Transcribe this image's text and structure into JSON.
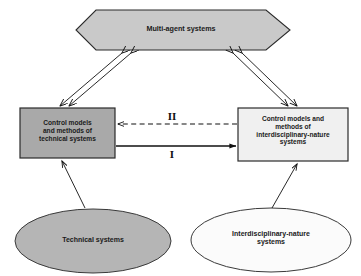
{
  "diagram": {
    "background_color": "#ffffff",
    "nodes": [
      {
        "id": "hexagon",
        "shape": "hexagon",
        "label": "Multi-agent systems",
        "fill": "#c9c9c9",
        "stroke": "#2b2b2b"
      },
      {
        "id": "left-box",
        "shape": "rectangle",
        "label": "Control models\nand methods of\ntechnical systems",
        "fill": "#a9a9a9",
        "stroke": "#2b2b2b"
      },
      {
        "id": "right-box",
        "shape": "rectangle",
        "label": "Control models and\nmethods of\ninterdisciplinary-nature\nsystems",
        "fill": "#f0f0f0",
        "stroke": "#2b2b2b"
      },
      {
        "id": "left-ellipse",
        "shape": "ellipse",
        "label": "Technical systems",
        "fill": "#b5b5b5",
        "stroke": "#3a3a3a"
      },
      {
        "id": "right-ellipse",
        "shape": "ellipse",
        "label": "Interdisciplinary-nature\nsystems",
        "fill": "#fbfbfb",
        "stroke": "#3a3a3a"
      }
    ],
    "edges": [
      {
        "id": "hexagon-left-box",
        "from": "hexagon",
        "to": "left-box",
        "style": "double-line",
        "arrows": "both",
        "label": ""
      },
      {
        "id": "hexagon-right-box",
        "from": "hexagon",
        "to": "right-box",
        "style": "double-line",
        "arrows": "both",
        "label": ""
      },
      {
        "id": "right-to-left-dashed",
        "from": "right-box",
        "to": "left-box",
        "style": "dashed",
        "arrows": "single",
        "label": "II"
      },
      {
        "id": "left-to-right-solid",
        "from": "left-box",
        "to": "right-box",
        "style": "solid",
        "arrows": "single",
        "label": "I"
      },
      {
        "id": "left-ellipse-to-left-box",
        "from": "left-ellipse",
        "to": "left-box",
        "style": "solid",
        "arrows": "single",
        "label": ""
      },
      {
        "id": "right-ellipse-to-right-box",
        "from": "right-ellipse",
        "to": "right-box",
        "style": "solid",
        "arrows": "single",
        "label": ""
      }
    ]
  }
}
